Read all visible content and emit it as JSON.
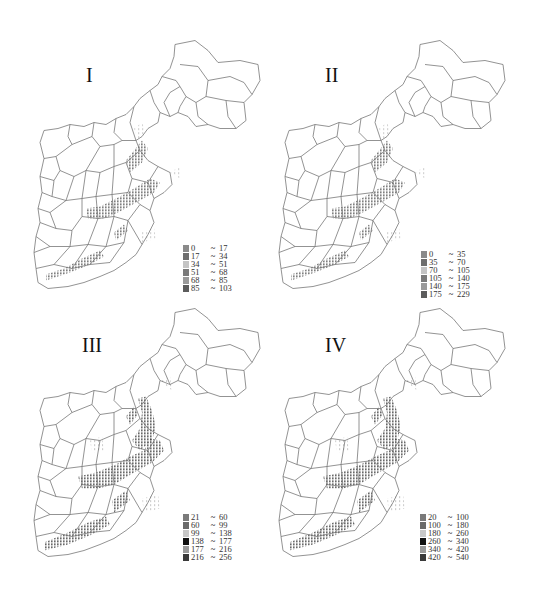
{
  "figure": {
    "background": "#ffffff",
    "outline_color": "#777777"
  },
  "panels": [
    {
      "id": "I",
      "label": "I",
      "legend": [
        {
          "low": "0",
          "high": "17",
          "color": "#8a8a8a"
        },
        {
          "low": "17",
          "high": "34",
          "color": "#6e6e6e"
        },
        {
          "low": "34",
          "high": "51",
          "color": "#c4c4c4"
        },
        {
          "low": "51",
          "high": "68",
          "color": "#7a7a7a"
        },
        {
          "low": "68",
          "high": "85",
          "color": "#9a9a9a"
        },
        {
          "low": "85",
          "high": "103",
          "color": "#5c5c5c"
        }
      ]
    },
    {
      "id": "II",
      "label": "II",
      "legend": [
        {
          "low": "0",
          "high": "35",
          "color": "#8a8a8a"
        },
        {
          "low": "35",
          "high": "70",
          "color": "#6e6e6e"
        },
        {
          "low": "70",
          "high": "105",
          "color": "#c4c4c4"
        },
        {
          "low": "105",
          "high": "140",
          "color": "#7a7a7a"
        },
        {
          "low": "140",
          "high": "175",
          "color": "#9a9a9a"
        },
        {
          "low": "175",
          "high": "229",
          "color": "#5c5c5c"
        }
      ]
    },
    {
      "id": "III",
      "label": "III",
      "legend": [
        {
          "low": "21",
          "high": "60",
          "color": "#7a7a7a"
        },
        {
          "low": "60",
          "high": "99",
          "color": "#6a6a6a"
        },
        {
          "low": "99",
          "high": "138",
          "color": "#c8c8c8"
        },
        {
          "low": "138",
          "high": "177",
          "color": "#111111"
        },
        {
          "low": "177",
          "high": "216",
          "color": "#9a9a9a"
        },
        {
          "low": "216",
          "high": "256",
          "color": "#3a3a3a"
        }
      ]
    },
    {
      "id": "IV",
      "label": "IV",
      "legend": [
        {
          "low": "20",
          "high": "100",
          "color": "#7a7a7a"
        },
        {
          "low": "100",
          "high": "180",
          "color": "#6a6a6a"
        },
        {
          "low": "180",
          "high": "260",
          "color": "#c8c8c8"
        },
        {
          "low": "260",
          "high": "340",
          "color": "#111111"
        },
        {
          "low": "340",
          "high": "420",
          "color": "#9a9a9a"
        },
        {
          "low": "420",
          "high": "540",
          "color": "#3a3a3a"
        }
      ]
    }
  ],
  "legend_separator": "~"
}
